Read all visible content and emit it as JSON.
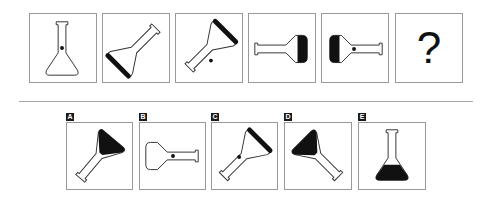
{
  "puzzle": {
    "sequence": [
      {
        "id": "s1",
        "description": "upright flask, dot on neck, no fill"
      },
      {
        "id": "s2",
        "description": "flask rotated, thick bottom edge"
      },
      {
        "id": "s3",
        "description": "flask rotated, thick bottom edge, dot"
      },
      {
        "id": "s4",
        "description": "flask horizontal pointing left, filled bulb"
      },
      {
        "id": "s5",
        "description": "flask horizontal pointing right, filled bulb, dot"
      },
      {
        "id": "s6",
        "label": "?"
      }
    ],
    "options": [
      {
        "id": "A",
        "label": "A"
      },
      {
        "id": "B",
        "label": "B"
      },
      {
        "id": "C",
        "label": "C"
      },
      {
        "id": "D",
        "label": "D"
      },
      {
        "id": "E",
        "label": "E"
      }
    ]
  },
  "colors": {
    "stroke": "#333333",
    "fill": "#111111",
    "border": "#9a9a9a"
  }
}
